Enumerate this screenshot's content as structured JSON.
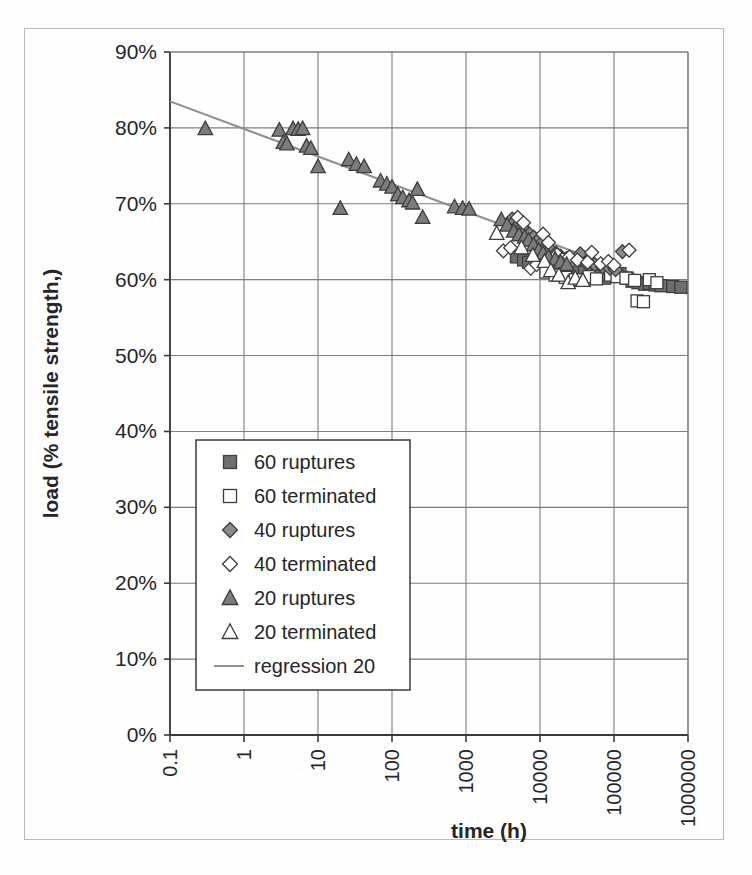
{
  "chart_data": {
    "type": "scatter",
    "title": "",
    "xlabel": "time (h)",
    "ylabel": "load (% tensile strength,)",
    "xscale": "log",
    "xlim": [
      0.1,
      1000000
    ],
    "ylim": [
      0,
      0.9
    ],
    "xticklabels": [
      "0.1",
      "1",
      "10",
      "100",
      "1000",
      "10000",
      "100000",
      "1000000"
    ],
    "xtickvalues": [
      0.1,
      1,
      10,
      100,
      1000,
      10000,
      100000,
      1000000
    ],
    "yticklabels": [
      "0%",
      "10%",
      "20%",
      "30%",
      "40%",
      "50%",
      "60%",
      "70%",
      "80%",
      "90%"
    ],
    "ytickvalues": [
      0,
      10,
      20,
      30,
      40,
      50,
      60,
      70,
      80,
      90
    ],
    "grid": true,
    "legend_position": "lower-left-inside",
    "series": [
      {
        "name": "60 ruptures",
        "marker": "square",
        "fill": "filled",
        "color": "#6e6e6e",
        "points": [
          [
            4800,
            63.0
          ],
          [
            6000,
            62.6
          ],
          [
            7000,
            62.3
          ],
          [
            9000,
            63.2
          ],
          [
            11000,
            62.9
          ],
          [
            12000,
            62.4
          ],
          [
            15000,
            62.0
          ],
          [
            17000,
            61.6
          ],
          [
            21000,
            62.5
          ],
          [
            26000,
            61.9
          ],
          [
            33000,
            61.3
          ],
          [
            40000,
            61.0
          ],
          [
            52000,
            61.0
          ],
          [
            60000,
            60.5
          ],
          [
            75000,
            60.2
          ],
          [
            95000,
            61.0
          ],
          [
            120000,
            60.8
          ],
          [
            150000,
            60.2
          ],
          [
            175000,
            59.8
          ],
          [
            210000,
            59.6
          ],
          [
            260000,
            59.4
          ],
          [
            300000,
            59.5
          ],
          [
            360000,
            59.3
          ],
          [
            430000,
            59.2
          ],
          [
            620000,
            59.1
          ],
          [
            800000,
            59.0
          ]
        ]
      },
      {
        "name": "60 terminated",
        "marker": "square",
        "fill": "open",
        "color": "#555555",
        "points": [
          [
            12000,
            61.0
          ],
          [
            16000,
            60.6
          ],
          [
            22000,
            60.3
          ],
          [
            30000,
            60.0
          ],
          [
            46000,
            60.4
          ],
          [
            58000,
            60.1
          ],
          [
            90000,
            60.6
          ],
          [
            110000,
            60.4
          ],
          [
            145000,
            60.2
          ],
          [
            190000,
            59.9
          ],
          [
            205000,
            57.2
          ],
          [
            250000,
            57.1
          ],
          [
            300000,
            60.0
          ],
          [
            380000,
            59.6
          ]
        ]
      },
      {
        "name": "40 ruptures",
        "marker": "diamond",
        "fill": "filled",
        "color": "#8a8a8a",
        "points": [
          [
            4200,
            68.0
          ],
          [
            4600,
            67.7
          ],
          [
            5200,
            67.3
          ],
          [
            5800,
            66.9
          ],
          [
            6400,
            66.4
          ],
          [
            7200,
            66.0
          ],
          [
            8200,
            65.6
          ],
          [
            9400,
            65.2
          ],
          [
            10500,
            64.8
          ],
          [
            12000,
            64.3
          ],
          [
            14000,
            63.9
          ],
          [
            16500,
            63.5
          ],
          [
            19000,
            63.1
          ],
          [
            23000,
            62.8
          ],
          [
            28000,
            62.5
          ],
          [
            35000,
            63.4
          ],
          [
            42000,
            62.2
          ],
          [
            55000,
            62.0
          ],
          [
            70000,
            61.7
          ],
          [
            88000,
            61.5
          ],
          [
            105000,
            61.3
          ],
          [
            130000,
            63.7
          ]
        ]
      },
      {
        "name": "40 terminated",
        "marker": "diamond",
        "fill": "open",
        "color": "#9a9a9a",
        "points": [
          [
            3200,
            63.8
          ],
          [
            4000,
            64.2
          ],
          [
            5000,
            68.2
          ],
          [
            6000,
            67.5
          ],
          [
            7500,
            61.5
          ],
          [
            9000,
            62.0
          ],
          [
            11000,
            66.0
          ],
          [
            13000,
            64.9
          ],
          [
            17000,
            63.3
          ],
          [
            20000,
            62.7
          ],
          [
            25000,
            63.0
          ],
          [
            32000,
            62.6
          ],
          [
            44000,
            62.3
          ],
          [
            50000,
            63.6
          ],
          [
            66000,
            62.1
          ],
          [
            84000,
            62.4
          ],
          [
            100000,
            61.9
          ],
          [
            160000,
            63.9
          ]
        ]
      },
      {
        "name": "20 ruptures",
        "marker": "triangle",
        "fill": "filled",
        "color": "#7c7c7c",
        "points": [
          [
            0.3,
            79.9
          ],
          [
            3.0,
            79.7
          ],
          [
            3.4,
            78.1
          ],
          [
            3.8,
            77.9
          ],
          [
            4.6,
            79.9
          ],
          [
            5.4,
            79.8
          ],
          [
            6.2,
            79.9
          ],
          [
            7.0,
            77.6
          ],
          [
            8.0,
            77.3
          ],
          [
            10.0,
            74.9
          ],
          [
            20.0,
            69.4
          ],
          [
            26.0,
            75.8
          ],
          [
            33.0,
            75.2
          ],
          [
            42.0,
            74.9
          ],
          [
            70.0,
            73.0
          ],
          [
            85.0,
            72.6
          ],
          [
            100.0,
            72.2
          ],
          [
            120.0,
            71.2
          ],
          [
            140.0,
            70.8
          ],
          [
            170.0,
            70.4
          ],
          [
            190.0,
            70.1
          ],
          [
            220.0,
            71.9
          ],
          [
            260.0,
            68.2
          ],
          [
            700.0,
            69.6
          ],
          [
            900.0,
            69.4
          ],
          [
            1100.0,
            69.3
          ],
          [
            3000.0,
            67.9
          ],
          [
            3600.0,
            67.2
          ],
          [
            4400.0,
            66.4
          ],
          [
            5200.0,
            65.9
          ],
          [
            6200.0,
            65.6
          ],
          [
            7000.0,
            65.2
          ],
          [
            8200.0,
            64.6
          ],
          [
            9600.0,
            63.9
          ],
          [
            11000.0,
            63.5
          ],
          [
            13000.0,
            63.0
          ],
          [
            16000.0,
            62.7
          ],
          [
            19000.0,
            62.3
          ],
          [
            23000.0,
            62.0
          ]
        ]
      },
      {
        "name": "20 terminated",
        "marker": "triangle",
        "fill": "open",
        "color": "#999999",
        "points": [
          [
            2600,
            66.1
          ],
          [
            5600,
            64.2
          ],
          [
            8000,
            63.2
          ],
          [
            11500,
            62.4
          ],
          [
            14000,
            61.2
          ],
          [
            18000,
            60.6
          ],
          [
            24000,
            59.6
          ],
          [
            30000,
            60.2
          ],
          [
            38000,
            59.9
          ]
        ]
      }
    ],
    "regression": {
      "name": "regression 20",
      "color": "#8f8f8f",
      "x_start": 0.1,
      "y_start": 83.5,
      "x_end": 1000000,
      "y_end": 58.1
    }
  },
  "legend": {
    "items": [
      {
        "label": "60 ruptures",
        "marker": "square",
        "fill": "filled"
      },
      {
        "label": "60 terminated",
        "marker": "square",
        "fill": "open"
      },
      {
        "label": "40 ruptures",
        "marker": "diamond",
        "fill": "filled"
      },
      {
        "label": "40 terminated",
        "marker": "diamond",
        "fill": "open"
      },
      {
        "label": "20 ruptures",
        "marker": "triangle",
        "fill": "filled"
      },
      {
        "label": "20 terminated",
        "marker": "triangle",
        "fill": "open"
      },
      {
        "label": "regression 20",
        "marker": "line",
        "fill": "line"
      }
    ]
  },
  "colors": {
    "axis": "#3a3a3a",
    "grid": "#7d7d7d",
    "frame": "#b9b9b5",
    "text": "#262626",
    "regression": "#8f8f8f",
    "marker_filled": "#777777",
    "marker_open": "#ffffff",
    "marker_edge": "#3d3d3d"
  }
}
